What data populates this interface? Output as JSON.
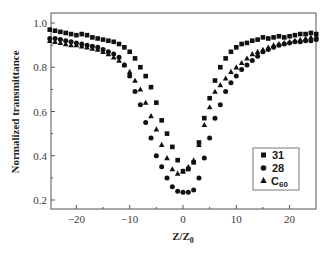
{
  "chart_data": {
    "type": "scatter",
    "title": "",
    "xlabel": "Z/Z",
    "xlabel_subscript": "0",
    "ylabel": "Normalized transmittance",
    "xlim": [
      -25,
      25
    ],
    "ylim": [
      0.15,
      1.05
    ],
    "x_ticks": [
      -20,
      -10,
      0,
      10,
      20
    ],
    "x_tick_labels": [
      "−20",
      "−10",
      "0",
      "10",
      "20"
    ],
    "y_ticks": [
      0.2,
      0.4,
      0.6,
      0.8,
      1.0
    ],
    "y_tick_labels": [
      "0.2",
      "0.4",
      "0.6",
      "0.8",
      "1.0"
    ],
    "grid": false,
    "legend_position": "lower right (inside)",
    "series": [
      {
        "name": "31",
        "marker": "square",
        "color": "#111111",
        "points": [
          [
            -25,
            0.97
          ],
          [
            -24,
            0.965
          ],
          [
            -23,
            0.96
          ],
          [
            -22,
            0.955
          ],
          [
            -21,
            0.95
          ],
          [
            -20,
            0.945
          ],
          [
            -19,
            0.95
          ],
          [
            -18,
            0.945
          ],
          [
            -17,
            0.935
          ],
          [
            -16,
            0.93
          ],
          [
            -15,
            0.925
          ],
          [
            -14,
            0.92
          ],
          [
            -13,
            0.915
          ],
          [
            -12,
            0.905
          ],
          [
            -11,
            0.89
          ],
          [
            -10,
            0.87
          ],
          [
            -9,
            0.84
          ],
          [
            -8,
            0.8
          ],
          [
            -7,
            0.76
          ],
          [
            -6,
            0.71
          ],
          [
            -5,
            0.64
          ],
          [
            -4,
            0.56
          ],
          [
            -3,
            0.5
          ],
          [
            -2,
            0.44
          ],
          [
            -1,
            0.38
          ],
          [
            0,
            0.33
          ],
          [
            1,
            0.34
          ],
          [
            2,
            0.37
          ],
          [
            3,
            0.46
          ],
          [
            4,
            0.57
          ],
          [
            5,
            0.66
          ],
          [
            6,
            0.74
          ],
          [
            7,
            0.8
          ],
          [
            8,
            0.84
          ],
          [
            9,
            0.87
          ],
          [
            10,
            0.89
          ],
          [
            11,
            0.905
          ],
          [
            12,
            0.91
          ],
          [
            13,
            0.92
          ],
          [
            14,
            0.925
          ],
          [
            15,
            0.935
          ],
          [
            16,
            0.93
          ],
          [
            17,
            0.935
          ],
          [
            18,
            0.94
          ],
          [
            19,
            0.935
          ],
          [
            20,
            0.94
          ],
          [
            21,
            0.945
          ],
          [
            22,
            0.95
          ],
          [
            23,
            0.95
          ],
          [
            24,
            0.955
          ],
          [
            25,
            0.95
          ]
        ]
      },
      {
        "name": "28",
        "marker": "circle",
        "color": "#111111",
        "points": [
          [
            -25,
            0.93
          ],
          [
            -24,
            0.93
          ],
          [
            -23,
            0.925
          ],
          [
            -22,
            0.92
          ],
          [
            -21,
            0.915
          ],
          [
            -20,
            0.91
          ],
          [
            -19,
            0.905
          ],
          [
            -18,
            0.9
          ],
          [
            -17,
            0.895
          ],
          [
            -16,
            0.89
          ],
          [
            -15,
            0.88
          ],
          [
            -14,
            0.87
          ],
          [
            -13,
            0.86
          ],
          [
            -12,
            0.845
          ],
          [
            -11,
            0.81
          ],
          [
            -10,
            0.76
          ],
          [
            -9,
            0.69
          ],
          [
            -8,
            0.63
          ],
          [
            -7,
            0.55
          ],
          [
            -6,
            0.48
          ],
          [
            -5,
            0.4
          ],
          [
            -4,
            0.35
          ],
          [
            -3,
            0.3
          ],
          [
            -2,
            0.26
          ],
          [
            -1,
            0.24
          ],
          [
            0,
            0.235
          ],
          [
            1,
            0.235
          ],
          [
            2,
            0.245
          ],
          [
            3,
            0.3
          ],
          [
            4,
            0.39
          ],
          [
            5,
            0.48
          ],
          [
            6,
            0.57
          ],
          [
            7,
            0.63
          ],
          [
            8,
            0.69
          ],
          [
            9,
            0.73
          ],
          [
            10,
            0.76
          ],
          [
            11,
            0.79
          ],
          [
            12,
            0.81
          ],
          [
            13,
            0.83
          ],
          [
            14,
            0.85
          ],
          [
            15,
            0.87
          ],
          [
            16,
            0.88
          ],
          [
            17,
            0.89
          ],
          [
            18,
            0.9
          ],
          [
            19,
            0.905
          ],
          [
            20,
            0.91
          ],
          [
            21,
            0.915
          ],
          [
            22,
            0.915
          ],
          [
            23,
            0.92
          ],
          [
            24,
            0.92
          ],
          [
            25,
            0.925
          ]
        ]
      },
      {
        "name": "C60",
        "label_main": "C",
        "label_sub": "60",
        "marker": "triangle",
        "color": "#111111",
        "points": [
          [
            -25,
            0.92
          ],
          [
            -24,
            0.915
          ],
          [
            -23,
            0.91
          ],
          [
            -22,
            0.905
          ],
          [
            -21,
            0.9
          ],
          [
            -20,
            0.9
          ],
          [
            -19,
            0.895
          ],
          [
            -18,
            0.89
          ],
          [
            -17,
            0.885
          ],
          [
            -16,
            0.88
          ],
          [
            -15,
            0.87
          ],
          [
            -14,
            0.86
          ],
          [
            -13,
            0.845
          ],
          [
            -12,
            0.83
          ],
          [
            -11,
            0.81
          ],
          [
            -10,
            0.78
          ],
          [
            -9,
            0.74
          ],
          [
            -8,
            0.7
          ],
          [
            -7,
            0.64
          ],
          [
            -6,
            0.58
          ],
          [
            -5,
            0.52
          ],
          [
            -4,
            0.45
          ],
          [
            -3,
            0.39
          ],
          [
            -2,
            0.34
          ],
          [
            -1,
            0.32
          ],
          [
            0,
            0.33
          ],
          [
            1,
            0.35
          ],
          [
            2,
            0.38
          ],
          [
            3,
            0.45
          ],
          [
            4,
            0.54
          ],
          [
            5,
            0.62
          ],
          [
            6,
            0.69
          ],
          [
            7,
            0.72
          ],
          [
            8,
            0.75
          ],
          [
            9,
            0.78
          ],
          [
            10,
            0.8
          ],
          [
            11,
            0.82
          ],
          [
            12,
            0.84
          ],
          [
            13,
            0.86
          ],
          [
            14,
            0.87
          ],
          [
            15,
            0.88
          ],
          [
            16,
            0.89
          ],
          [
            17,
            0.9
          ],
          [
            18,
            0.905
          ],
          [
            19,
            0.91
          ],
          [
            20,
            0.915
          ],
          [
            21,
            0.92
          ],
          [
            22,
            0.925
          ],
          [
            23,
            0.93
          ],
          [
            24,
            0.935
          ],
          [
            25,
            0.94
          ]
        ]
      }
    ]
  },
  "legend": {
    "items": [
      {
        "marker": "square",
        "label": "31"
      },
      {
        "marker": "circle",
        "label": "28"
      },
      {
        "marker": "triangle",
        "label": "C",
        "sub": "60"
      }
    ]
  },
  "axes": {
    "ylabel": "Normalized transmittance",
    "xlabel_main": "Z/Z",
    "xlabel_sub": "0"
  }
}
